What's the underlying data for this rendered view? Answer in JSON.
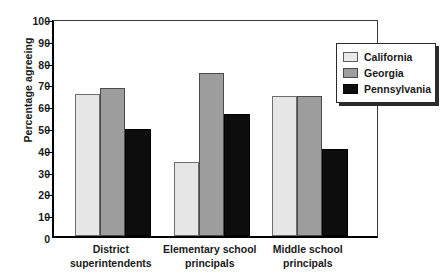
{
  "chart_data": {
    "type": "bar",
    "title": "",
    "xlabel": "",
    "ylabel": "Percentage agreeing",
    "ylim": [
      0,
      100
    ],
    "yticks": [
      0,
      10,
      20,
      30,
      40,
      50,
      60,
      70,
      80,
      90,
      100
    ],
    "ytick_labels": [
      "0",
      "10",
      "20",
      "30",
      "40",
      "50",
      "60",
      "70",
      "80",
      "90",
      "100"
    ],
    "grid": false,
    "legend_position": "top-right",
    "categories": [
      "District superintendents",
      "Elementary school principals",
      "Middle school principals"
    ],
    "category_lines": [
      [
        "District",
        "superintendents"
      ],
      [
        "Elementary school",
        "principals"
      ],
      [
        "Middle school",
        "principals"
      ]
    ],
    "series": [
      {
        "name": "California",
        "color": "#e6e6e6",
        "values": [
          65,
          34,
          64
        ]
      },
      {
        "name": "Georgia",
        "color": "#9d9d9d",
        "values": [
          68,
          75,
          64
        ]
      },
      {
        "name": "Pennsylvania",
        "color": "#0d0d0d",
        "values": [
          49,
          56,
          40
        ]
      }
    ]
  },
  "legend": {
    "entries": [
      {
        "label": "California",
        "swatch": "california"
      },
      {
        "label": "Georgia",
        "swatch": "georgia"
      },
      {
        "label": "Pennsylvania",
        "swatch": "pennsylvania"
      }
    ]
  }
}
